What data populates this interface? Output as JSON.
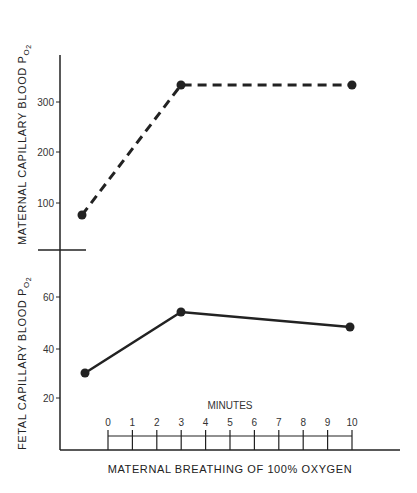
{
  "chart_data": [
    {
      "type": "line",
      "title": "",
      "ylabel": "MATERNAL CAPILLARY BLOOD PO2",
      "xlabel": "MATERNAL BREATHING OF 100% OXYGEN",
      "yticks": [
        100,
        200,
        300
      ],
      "ylim": [
        0,
        390
      ],
      "series": [
        {
          "name": "Maternal",
          "style": "dashed",
          "x": [
            -1,
            3,
            10
          ],
          "values": [
            75,
            335,
            335
          ]
        }
      ]
    },
    {
      "type": "line",
      "title": "",
      "ylabel": "FETAL CAPILLARY BLOOD PO2",
      "xlabel": "MATERNAL BREATHING OF 100% OXYGEN",
      "yticks": [
        20,
        40,
        60
      ],
      "ylim": [
        0,
        76
      ],
      "series": [
        {
          "name": "Fetal",
          "style": "solid",
          "x": [
            -1,
            3,
            10
          ],
          "values": [
            30,
            54,
            48
          ]
        }
      ]
    }
  ],
  "labels": {
    "maternal_ylabel": "MATERNAL CAPILLARY BLOOD P",
    "fetal_ylabel": "FETAL CAPILLARY BLOOD P",
    "subscript": "O2",
    "minutes": "MINUTES",
    "xlabel": "MATERNAL BREATHING OF 100% OXYGEN"
  },
  "maternal_ticks": [
    "300",
    "200",
    "100"
  ],
  "fetal_ticks": [
    "60",
    "40",
    "20"
  ],
  "minute_ticks": [
    "0",
    "1",
    "2",
    "3",
    "4",
    "5",
    "6",
    "7",
    "8",
    "9",
    "10"
  ]
}
